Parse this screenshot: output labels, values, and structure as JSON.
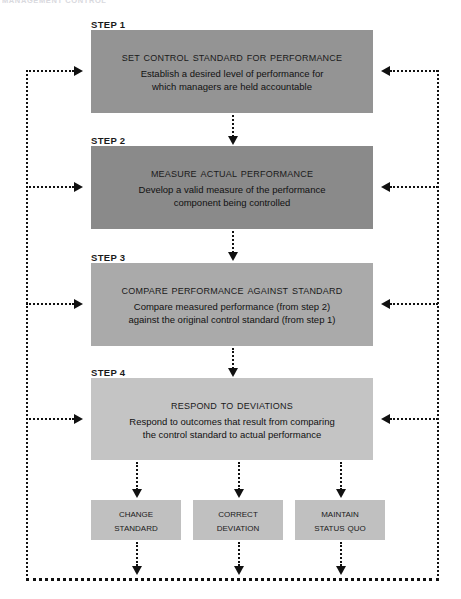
{
  "page": {
    "header_faint_text": "MANAGEMENT CONTROL",
    "width": 461,
    "height": 599,
    "background": "#ffffff"
  },
  "colors": {
    "box_step1": "#949494",
    "box_step2": "#8a8a8a",
    "box_step3": "#aaaaaa",
    "box_step4": "#c4c4c4",
    "box_outcome": "#c0c0c0",
    "line": "#111111",
    "text": "#1a1a1a"
  },
  "steps": [
    {
      "label": "STEP 1",
      "title": "Set Control Standard for Performance",
      "desc_line1": "Establish a desired level of performance for",
      "desc_line2": "which managers are held accountable",
      "color": "#949494",
      "top": 30,
      "height": 83,
      "label_top": 19
    },
    {
      "label": "STEP 2",
      "title": "Measure Actual Performance",
      "desc_line1": "Develop a valid measure of the performance",
      "desc_line2": "component being controlled",
      "color": "#8a8a8a",
      "top": 146,
      "height": 83,
      "label_top": 135
    },
    {
      "label": "STEP 3",
      "title": "Compare Performance Against Standard",
      "desc_line1": "Compare measured performance (from step 2)",
      "desc_line2": "against the original control standard (from step 1)",
      "color": "#aaaaaa",
      "top": 263,
      "height": 83,
      "label_top": 252
    },
    {
      "label": "STEP 4",
      "title": "Respond to Deviations",
      "desc_line1": "Respond to outcomes that result from comparing",
      "desc_line2": "the control standard to actual performance",
      "color": "#c4c4c4",
      "top": 378,
      "height": 82,
      "label_top": 367
    }
  ],
  "outcomes": [
    {
      "line1": "Change",
      "line2": "Standard",
      "left": 91,
      "width": 90
    },
    {
      "line1": "Correct",
      "line2": "Deviation",
      "left": 193,
      "width": 90
    },
    {
      "line1": "Maintain",
      "line2": "Status Quo",
      "left": 295,
      "width": 90
    }
  ],
  "connectors": {
    "left_rail_x": 26,
    "right_rail_x": 437,
    "bottom_rail_y": 578,
    "feedback_arrow_targets": [
      70,
      186,
      303,
      418
    ],
    "down_arrow_x": 232
  }
}
